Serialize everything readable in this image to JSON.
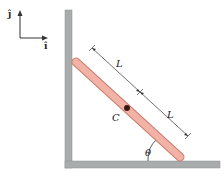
{
  "diagram": {
    "axes": {
      "vertical_unit_label": "ĵ",
      "horizontal_unit_label": "î"
    },
    "labels": {
      "upper_half_length": "L",
      "lower_half_length": "L",
      "center_of_mass": "C",
      "angle": "θ"
    },
    "colors": {
      "wall": "#a9acad",
      "wall_edge": "#8e9192",
      "rod_fill": "#f2b3a6",
      "rod_edge": "#c87a6c",
      "center_dot": "#3a1a14",
      "dimension_lines": "#333333"
    }
  }
}
